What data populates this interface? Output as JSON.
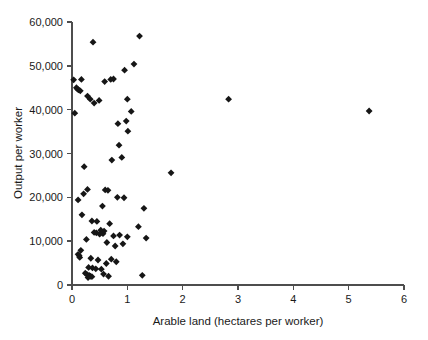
{
  "chart_data": {
    "type": "scatter",
    "title": "",
    "xlabel": "Arable land  (hectares per worker)",
    "ylabel": "Output per worker",
    "xlim": [
      0,
      6
    ],
    "ylim": [
      0,
      60000
    ],
    "xticks": [
      0,
      1,
      2,
      3,
      4,
      5,
      6
    ],
    "xtick_labels": [
      "0",
      "1",
      "2",
      "3",
      "4",
      "5",
      "6"
    ],
    "yticks": [
      0,
      10000,
      20000,
      30000,
      40000,
      50000,
      60000
    ],
    "ytick_labels": [
      "0",
      "10,000",
      "20,000",
      "30,000",
      "40,000",
      "50,000",
      "60,000"
    ],
    "grid": false,
    "legend": false,
    "marker": "diamond",
    "marker_color": "#161616",
    "marker_size": 3.4,
    "series": [
      {
        "name": "countries",
        "points": [
          [
            1.22,
            56800
          ],
          [
            0.38,
            55400
          ],
          [
            1.12,
            50400
          ],
          [
            0.95,
            49000
          ],
          [
            0.03,
            46800
          ],
          [
            0.17,
            46900
          ],
          [
            0.59,
            46400
          ],
          [
            0.7,
            46900
          ],
          [
            0.75,
            47000
          ],
          [
            0.08,
            45000
          ],
          [
            0.1,
            44700
          ],
          [
            0.12,
            44500
          ],
          [
            0.15,
            44300
          ],
          [
            1.0,
            42400
          ],
          [
            2.83,
            42400
          ],
          [
            0.28,
            43100
          ],
          [
            0.33,
            42400
          ],
          [
            0.49,
            42100
          ],
          [
            0.4,
            41500
          ],
          [
            0.05,
            39200
          ],
          [
            1.07,
            39600
          ],
          [
            5.37,
            39700
          ],
          [
            0.98,
            37400
          ],
          [
            0.83,
            36800
          ],
          [
            1.01,
            35100
          ],
          [
            0.85,
            31900
          ],
          [
            0.9,
            29100
          ],
          [
            0.72,
            28500
          ],
          [
            0.22,
            27000
          ],
          [
            1.79,
            25600
          ],
          [
            0.6,
            21700
          ],
          [
            0.65,
            21600
          ],
          [
            0.28,
            21800
          ],
          [
            0.21,
            20800
          ],
          [
            0.82,
            20000
          ],
          [
            0.11,
            19400
          ],
          [
            0.94,
            19900
          ],
          [
            0.18,
            16000
          ],
          [
            0.55,
            18000
          ],
          [
            1.3,
            17500
          ],
          [
            0.36,
            14600
          ],
          [
            0.45,
            14500
          ],
          [
            0.68,
            14000
          ],
          [
            1.2,
            13300
          ],
          [
            0.52,
            12500
          ],
          [
            0.58,
            12300
          ],
          [
            0.4,
            12000
          ],
          [
            0.44,
            11900
          ],
          [
            0.5,
            11600
          ],
          [
            0.56,
            11700
          ],
          [
            0.75,
            11200
          ],
          [
            1.0,
            11000
          ],
          [
            1.34,
            10700
          ],
          [
            0.86,
            11400
          ],
          [
            0.26,
            10400
          ],
          [
            0.63,
            9700
          ],
          [
            0.92,
            9400
          ],
          [
            0.78,
            8900
          ],
          [
            0.16,
            7900
          ],
          [
            0.11,
            7000
          ],
          [
            0.13,
            6700
          ],
          [
            0.14,
            6300
          ],
          [
            0.34,
            6100
          ],
          [
            0.47,
            5700
          ],
          [
            0.71,
            5900
          ],
          [
            0.8,
            5300
          ],
          [
            0.62,
            4900
          ],
          [
            0.3,
            4000
          ],
          [
            0.37,
            3900
          ],
          [
            0.43,
            3700
          ],
          [
            0.53,
            3600
          ],
          [
            0.24,
            2700
          ],
          [
            0.27,
            2400
          ],
          [
            0.31,
            2200
          ],
          [
            0.33,
            2000
          ],
          [
            0.36,
            1900
          ],
          [
            0.29,
            1700
          ],
          [
            0.57,
            2500
          ],
          [
            0.66,
            2000
          ],
          [
            1.27,
            2200
          ]
        ]
      }
    ]
  }
}
